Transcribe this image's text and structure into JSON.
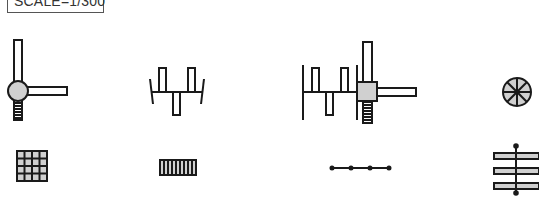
{
  "scale_label": "SCALE=1/300",
  "colors": {
    "stroke": "#1a1a1a",
    "fill_light": "#d0d0d0",
    "background": "#ffffff"
  },
  "symbols": [
    {
      "name": "joint-with-arms-and-spring",
      "row": 1,
      "col": 1
    },
    {
      "name": "beam-with-alternating-bars",
      "row": 1,
      "col": 2
    },
    {
      "name": "combined-assembly",
      "row": 1,
      "col": 3
    },
    {
      "name": "spoked-circle",
      "row": 1,
      "col": 4
    },
    {
      "name": "grid-4x4",
      "row": 2,
      "col": 1
    },
    {
      "name": "ladder",
      "row": 2,
      "col": 2
    },
    {
      "name": "line-with-nodes",
      "row": 2,
      "col": 3
    },
    {
      "name": "stacked-bars-on-axis",
      "row": 2,
      "col": 4
    }
  ]
}
